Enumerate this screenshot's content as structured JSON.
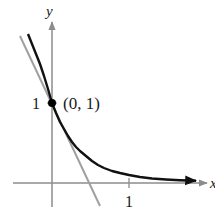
{
  "figure": {
    "type": "function-plot",
    "function": "y = e^(-2x)",
    "tangent_line": "y = 1 - 2x",
    "axes": {
      "x_label": "x",
      "y_label": "y",
      "x_ticks": [
        {
          "value": 1,
          "label": "1"
        }
      ],
      "y_ticks": [
        {
          "value": 1,
          "label": "1"
        }
      ]
    },
    "point": {
      "x": 0,
      "y": 1,
      "label": "(0, 1)"
    },
    "colors": {
      "curve": "#111111",
      "tangent": "#a0a0a0",
      "axes": "#8c8c8c",
      "point": "#000000",
      "text": "#1a1a1a"
    }
  }
}
